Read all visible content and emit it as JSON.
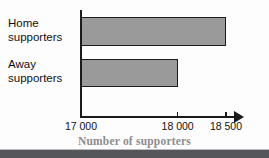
{
  "chart_data": {
    "type": "bar",
    "orientation": "horizontal",
    "title": "",
    "xlabel": "Number of supporters",
    "ylabel": "",
    "categories": [
      "Home\nsupporters",
      "Away\nsupporters"
    ],
    "values": [
      18500,
      18000
    ],
    "xlim": [
      17000,
      18500
    ],
    "xticks": [
      17000,
      18000,
      18500
    ],
    "xticklabels": [
      "17 000",
      "18 000",
      "18 500"
    ],
    "grid": false,
    "legend": null,
    "series": [
      {
        "name": "Supporters",
        "values": [
          18500,
          18000
        ]
      }
    ],
    "colors": {
      "bar_fill": "#9a9a9a",
      "bar_border": "#1b1b1b",
      "axis": "#1b1b1b",
      "tick_label": "#111111",
      "axis_title": "#8d8d8d",
      "background": "#fdfdfd",
      "bottom_band": "#55565a"
    },
    "annotations": {
      "x_axis_arrow": "arrow pointing right at end of value axis"
    }
  },
  "labels": {
    "home": "Home\nsupporters",
    "away": "Away\nsupporters"
  },
  "ticks": {
    "t0": "17 000",
    "t1": "18 000",
    "t2": "18 500"
  },
  "axis": {
    "title": "Number of supporters"
  }
}
